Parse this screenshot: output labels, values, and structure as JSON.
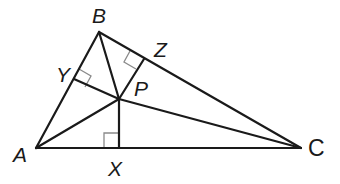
{
  "diagram": {
    "type": "triangle-incenter",
    "points": {
      "A": {
        "label": "A",
        "x": 36,
        "y": 148
      },
      "B": {
        "label": "B",
        "x": 99,
        "y": 32
      },
      "C": {
        "label": "C",
        "x": 301,
        "y": 148
      },
      "P": {
        "label": "P",
        "x": 119,
        "y": 99
      },
      "X": {
        "label": "X",
        "x": 119,
        "y": 148
      },
      "Y": {
        "label": "Y",
        "x": 74,
        "y": 79
      },
      "Z": {
        "label": "Z",
        "x": 144,
        "y": 59
      }
    },
    "segments": [
      "AB",
      "BC",
      "CA",
      "PA",
      "PB",
      "PC",
      "PX",
      "PY",
      "PZ"
    ],
    "right_angles": [
      "X",
      "Y",
      "Z"
    ],
    "colors": {
      "line": "#1a1a1a",
      "right_angle_mark": "#8a8a8a",
      "background": "#ffffff"
    }
  }
}
